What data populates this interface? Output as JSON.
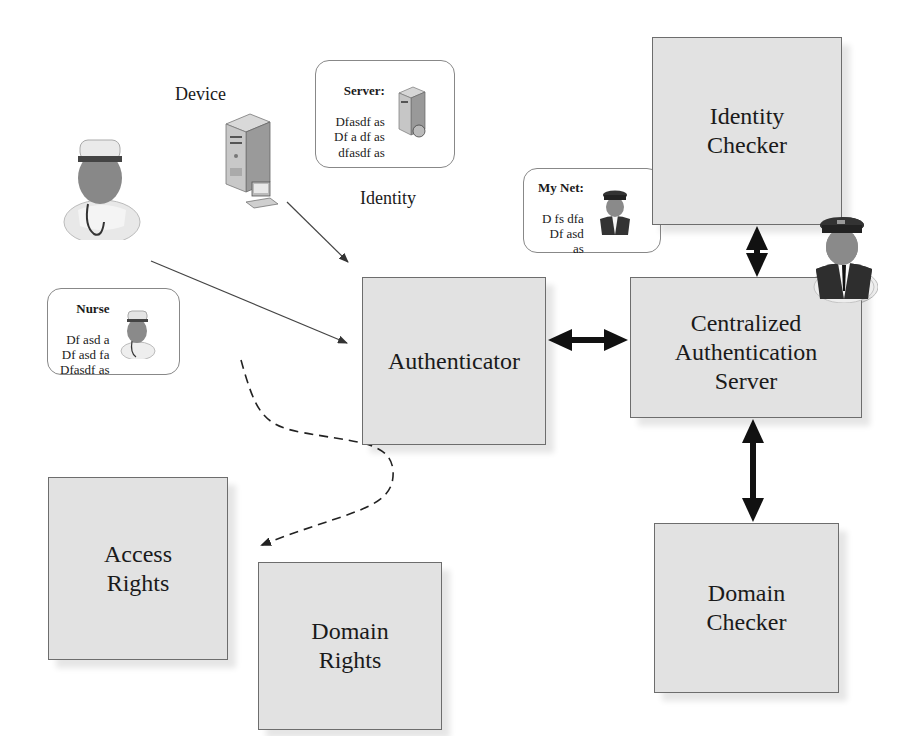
{
  "diagram": {
    "labels": {
      "device": "Device",
      "identity": "Identity"
    },
    "boxes": {
      "identity_checker": "Identity\nChecker",
      "authenticator": "Authenticator",
      "central_server": "Centralized\nAuthentication\nServer",
      "domain_checker": "Domain\nChecker",
      "access_rights": "Access\nRights",
      "domain_rights": "Domain\nRights"
    },
    "cards": {
      "server": {
        "title": "Server:",
        "lines": "Dfasdf as\nDf a df as\ndfasdf as",
        "icon": "server-icon"
      },
      "mynet": {
        "title": "My Net:",
        "lines": "D fs dfa\nDf asd\nas",
        "icon": "conductor-icon"
      },
      "nurse": {
        "title": "Nurse",
        "lines": "Df asd a\nDf asd fa\nDfasdf as",
        "icon": "nurse-icon"
      }
    },
    "connections": [
      {
        "from": "device",
        "to": "authenticator",
        "style": "thin-arrow"
      },
      {
        "from": "nurse",
        "to": "authenticator",
        "style": "thin-arrow"
      },
      {
        "from": "authenticator",
        "to": "central_server",
        "style": "bold-double-arrow"
      },
      {
        "from": "identity_checker",
        "to": "central_server",
        "style": "bold-double-arrow"
      },
      {
        "from": "central_server",
        "to": "domain_checker",
        "style": "bold-double-arrow"
      },
      {
        "from": "nurse",
        "to": "access_rights",
        "style": "dashed-curved-arrow"
      }
    ],
    "colors": {
      "box_fill": "#e2e2e2",
      "box_border": "#6d6d6d",
      "arrow": "#111111"
    }
  }
}
